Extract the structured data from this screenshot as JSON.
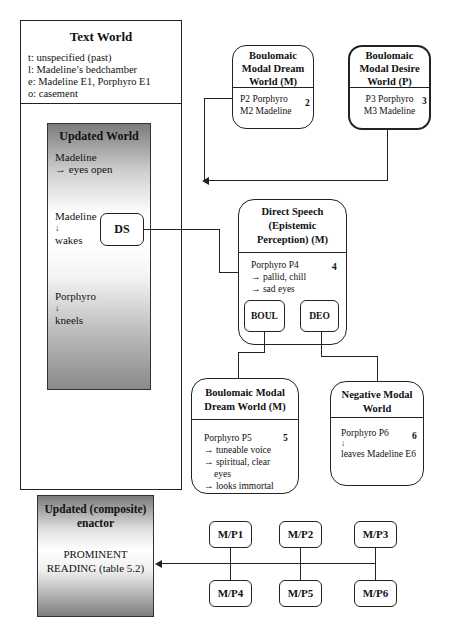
{
  "text_world": {
    "title": "Text World",
    "lines": [
      "t: unspecified (past)",
      "l: Madeline’s bedchamber",
      "e: Madeline E1, Porphyro E1",
      "o: casement"
    ]
  },
  "updated_world": {
    "title": "Updated World",
    "item1_name": "Madeline",
    "item1_desc": "→ eyes open",
    "item2_name": "Madeline",
    "item2_arrow": "↓",
    "item2_desc": "wakes",
    "item3_name": "Porphyro",
    "item3_arrow": "↓",
    "item3_desc": "kneels",
    "ds_label": "DS"
  },
  "boul_dream_top": {
    "title_l1": "Boulomaic",
    "title_l2": "Modal Dream",
    "title_l3": "World (M)",
    "line1": "P2 Porphyro",
    "line2": "M2 Madeline",
    "number": "2"
  },
  "boul_desire_top": {
    "title_l1": "Boulomaic",
    "title_l2": "Modal Desire",
    "title_l3": "World (P)",
    "line1": "P3 Porphyro",
    "line2": "M3 Madeline",
    "number": "3"
  },
  "direct_speech": {
    "title_l1": "Direct Speech",
    "title_l2": "(Epistemic",
    "title_l3": "Perception) (M)",
    "line1": "Porphyro P4",
    "line2": "→ pallid, chill",
    "line3": "→ sad eyes",
    "number": "4",
    "boul_label": "BOUL",
    "deo_label": "DEO"
  },
  "boul_dream_bottom": {
    "title_l1": "Boulomaic Modal",
    "title_l2": "Dream World (M)",
    "line1": "Porphyro P5",
    "line2": "→ tuneable voice",
    "line3": "→ spiritual, clear",
    "line4": "eyes",
    "line5": "→ looks immortal",
    "number": "5"
  },
  "negative_modal": {
    "title_l1": "Negative Modal",
    "title_l2": "World",
    "line1": "Porphyro P6",
    "line2": "↓",
    "line3": "leaves Madeline E6",
    "number": "6"
  },
  "composite_enactor": {
    "title_l1": "Updated (composite)",
    "title_l2": "enactor",
    "reading_l1": "PROMINENT",
    "reading_l2": "READING (table 5.2)"
  },
  "mp_nodes": {
    "top": [
      "M/P1",
      "M/P2",
      "M/P3"
    ],
    "bottom": [
      "M/P4",
      "M/P5",
      "M/P6"
    ]
  }
}
